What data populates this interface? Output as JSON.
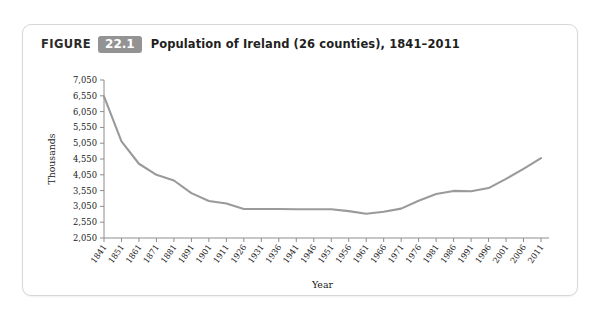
{
  "figure": {
    "label_word": "FIGURE",
    "number": "22.1",
    "title": "Population of Ireland (26 counties), 1841–2011"
  },
  "chart_data": {
    "type": "line",
    "title": "Population of Ireland (26 counties), 1841–2011",
    "xlabel": "Year",
    "ylabel": "Thousands",
    "grid": false,
    "legend": "none",
    "line_color": "#9a9a9a",
    "axis_color": "#8c8c8c",
    "ylim": [
      2050,
      7050
    ],
    "yticks": [
      2050,
      2550,
      3050,
      3550,
      4050,
      4550,
      5050,
      5550,
      6050,
      6550,
      7050
    ],
    "ytick_labels": [
      "2,050",
      "2,550",
      "3,050",
      "3,550",
      "4,050",
      "4,550",
      "5,050",
      "5,550",
      "6,050",
      "6,550",
      "7,050"
    ],
    "categories": [
      "1841",
      "1851",
      "1861",
      "1871",
      "1881",
      "1891",
      "1901",
      "1911",
      "1926",
      "1931",
      "1936",
      "1941",
      "1946",
      "1951",
      "1956",
      "1961",
      "1966",
      "1971",
      "1976",
      "1981",
      "1986",
      "1991",
      "1996",
      "2001",
      "2006",
      "2011"
    ],
    "values": [
      6530,
      5110,
      4400,
      4050,
      3870,
      3470,
      3220,
      3140,
      2970,
      2970,
      2970,
      2960,
      2960,
      2960,
      2900,
      2820,
      2880,
      2980,
      3230,
      3440,
      3540,
      3530,
      3630,
      3920,
      4240,
      4580
    ],
    "series": [
      {
        "name": "Population of Ireland (26 counties)",
        "values": [
          6530,
          5110,
          4400,
          4050,
          3870,
          3470,
          3220,
          3140,
          2970,
          2970,
          2970,
          2960,
          2960,
          2960,
          2900,
          2820,
          2880,
          2980,
          3230,
          3440,
          3540,
          3530,
          3630,
          3920,
          4240,
          4580
        ]
      }
    ]
  }
}
